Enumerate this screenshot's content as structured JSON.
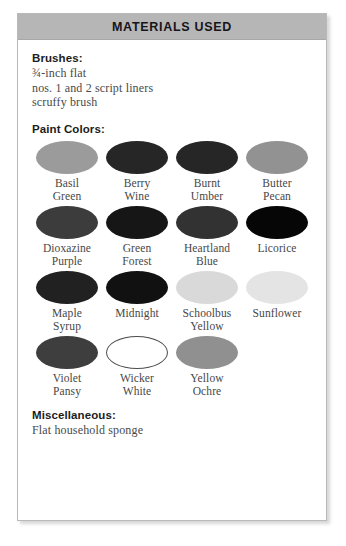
{
  "box": {
    "header_title": "MATERIALS USED",
    "header_bg": "#b6b6b6",
    "border_color": "#b9b9b9",
    "background": "#ffffff"
  },
  "brushes": {
    "heading": "Brushes:",
    "items": [
      "¾-inch flat",
      "nos. 1 and 2 script liners",
      "scruffy brush"
    ]
  },
  "paint_colors": {
    "heading": "Paint Colors:",
    "swatches": [
      {
        "line1": "Basil",
        "line2": "Green",
        "color": "#9b9b9b",
        "outlined": false
      },
      {
        "line1": "Berry",
        "line2": "Wine",
        "color": "#262626",
        "outlined": false
      },
      {
        "line1": "Burnt",
        "line2": "Umber",
        "color": "#262626",
        "outlined": false
      },
      {
        "line1": "Butter",
        "line2": "Pecan",
        "color": "#929292",
        "outlined": false
      },
      {
        "line1": "Dioxazine",
        "line2": "Purple",
        "color": "#3c3c3c",
        "outlined": false
      },
      {
        "line1": "Green",
        "line2": "Forest",
        "color": "#161616",
        "outlined": false
      },
      {
        "line1": "Heartland",
        "line2": "Blue",
        "color": "#323232",
        "outlined": false
      },
      {
        "line1": "Licorice",
        "line2": "",
        "color": "#060606",
        "outlined": false
      },
      {
        "line1": "Maple",
        "line2": "Syrup",
        "color": "#212121",
        "outlined": false
      },
      {
        "line1": "Midnight",
        "line2": "",
        "color": "#111111",
        "outlined": false
      },
      {
        "line1": "Schoolbus",
        "line2": "Yellow",
        "color": "#d9d9d9",
        "outlined": false
      },
      {
        "line1": "Sunflower",
        "line2": "",
        "color": "#e4e4e4",
        "outlined": false
      },
      {
        "line1": "Violet",
        "line2": "Pansy",
        "color": "#3e3e3e",
        "outlined": false
      },
      {
        "line1": "Wicker",
        "line2": "White",
        "color": "#ffffff",
        "outlined": true
      },
      {
        "line1": "Yellow",
        "line2": "Ochre",
        "color": "#909090",
        "outlined": false
      }
    ]
  },
  "miscellaneous": {
    "heading": "Miscellaneous:",
    "items": [
      "Flat household sponge"
    ]
  }
}
